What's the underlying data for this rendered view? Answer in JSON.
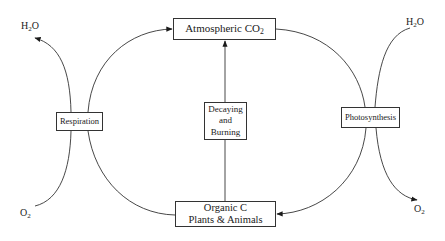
{
  "diagram": {
    "type": "carbon-cycle",
    "nodes": {
      "atmospheric_co2": {
        "text": "Atmospheric CO",
        "sub": "2"
      },
      "decaying": {
        "lines": [
          "Decaying",
          "and",
          "Burning"
        ]
      },
      "organic_c": {
        "lines": [
          "Organic C",
          "Plants & Animals"
        ]
      },
      "respiration": {
        "text": "Respiration"
      },
      "photosynthesis": {
        "text": "Photosynthesis"
      }
    },
    "outputs": {
      "left_h2o": {
        "pre": "H",
        "sub": "2",
        "post": "O"
      },
      "left_o2": {
        "pre": "O",
        "sub": "2"
      },
      "right_h2o": {
        "pre": "H",
        "sub": "2",
        "post": "O"
      },
      "right_o2": {
        "pre": "O",
        "sub": "2"
      }
    },
    "edges": [
      {
        "from": "Respiration",
        "to": "Atmospheric CO2"
      },
      {
        "from": "Respiration",
        "to": "H2O"
      },
      {
        "from": "O2",
        "to": "Respiration"
      },
      {
        "from": "Organic C",
        "to": "Respiration"
      },
      {
        "from": "Atmospheric CO2",
        "to": "Photosynthesis"
      },
      {
        "from": "H2O",
        "to": "Photosynthesis"
      },
      {
        "from": "Photosynthesis",
        "to": "Organic C"
      },
      {
        "from": "Photosynthesis",
        "to": "O2"
      },
      {
        "from": "Organic C",
        "to": "Decaying and Burning"
      },
      {
        "from": "Decaying and Burning",
        "to": "Atmospheric CO2"
      }
    ]
  }
}
